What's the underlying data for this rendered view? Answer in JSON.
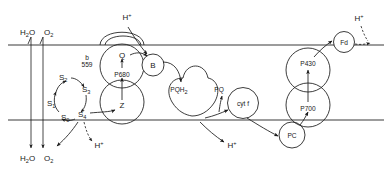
{
  "diagram": {
    "type": "schematic",
    "membrane": {
      "upper_line_y": 45,
      "lower_line_y": 120,
      "stroke_color": "#3a3a3a"
    },
    "water_splitting": {
      "top_labels": [
        {
          "id": "h2o-top",
          "text": "H",
          "sub": "2",
          "tail": "O",
          "x": 24,
          "y": 34
        },
        {
          "id": "o2-top",
          "text": "O",
          "sub": "2",
          "tail": "",
          "x": 48,
          "y": 34
        }
      ],
      "bottom_labels": [
        {
          "id": "h2o-bottom",
          "text": "H",
          "sub": "2",
          "tail": "O",
          "x": 24,
          "y": 160
        },
        {
          "id": "o2-bottom",
          "text": "O",
          "sub": "2",
          "tail": "",
          "x": 48,
          "y": 160
        }
      ]
    },
    "s_states": {
      "label": "S-state (Kok) cycle",
      "items": [
        {
          "id": "s0",
          "base": "S",
          "sub": "0",
          "x": 65,
          "y": 117
        },
        {
          "id": "s1",
          "base": "S",
          "sub": "1",
          "x": 52,
          "y": 103
        },
        {
          "id": "s2",
          "base": "S",
          "sub": "2",
          "x": 63,
          "y": 80
        },
        {
          "id": "s3",
          "base": "S",
          "sub": "3",
          "x": 86,
          "y": 90
        },
        {
          "id": "s4",
          "base": "S",
          "sub": "4",
          "x": 82,
          "y": 115
        }
      ]
    },
    "carriers": [
      {
        "id": "b559",
        "label_top": "b",
        "label_bottom": "559",
        "cx": 87,
        "cy": 62,
        "r": 11
      },
      {
        "id": "carrier-b",
        "label": "B",
        "cx": 153,
        "cy": 65,
        "r": 11
      },
      {
        "id": "cyt-f",
        "label": "cyt f",
        "cx": 243,
        "cy": 103,
        "r": 15.5
      },
      {
        "id": "pc",
        "label": "PC",
        "cx": 292,
        "cy": 135,
        "r": 13
      },
      {
        "id": "fd",
        "label": "Fd",
        "cx": 344,
        "cy": 42,
        "r": 10.5
      }
    ],
    "reaction_centers": [
      {
        "id": "psii",
        "top_label": "Q",
        "center_label": "P680",
        "bottom_label": "Z",
        "cx": 122,
        "top_y": 58,
        "center_y": 74,
        "bottom_y": 106
      },
      {
        "id": "psi",
        "top_label": "P430",
        "center_label": "",
        "bottom_label": "P700",
        "cx": 308,
        "top_y": 63,
        "center_y": 0,
        "bottom_y": 108
      }
    ],
    "quinone_pool": [
      {
        "id": "pqh2",
        "base": "PQH",
        "sub": "2",
        "x": 179,
        "y": 89
      },
      {
        "id": "pq",
        "base": "PQ",
        "sub": "",
        "x": 219,
        "y": 89
      }
    ],
    "protons": [
      {
        "id": "h-plus-psii-top",
        "base": "H",
        "sup": "+",
        "x": 130,
        "y": 16
      },
      {
        "id": "h-plus-oec",
        "base": "H",
        "sup": "+",
        "x": 101,
        "y": 145
      },
      {
        "id": "h-plus-lumen",
        "base": "H",
        "sup": "+",
        "x": 234,
        "y": 145
      },
      {
        "id": "h-plus-stroma",
        "base": "H",
        "sup": "+",
        "x": 361,
        "y": 18
      }
    ]
  }
}
